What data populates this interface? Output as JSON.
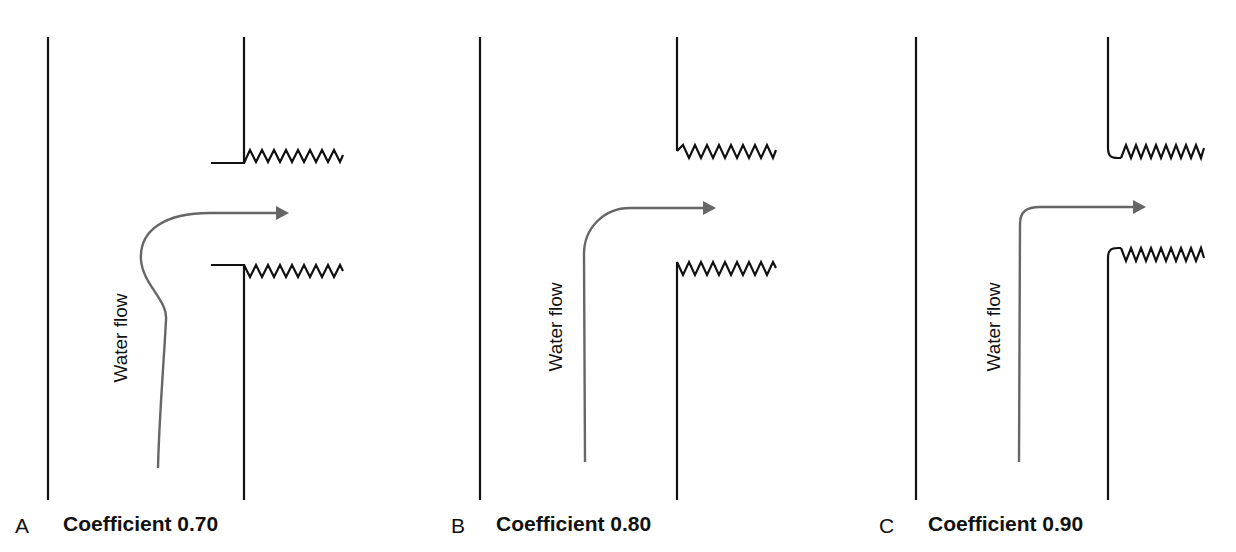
{
  "figure": {
    "panels": [
      {
        "id": "A",
        "letter": "A",
        "caption": "Coefficient 0.70",
        "flow_label": "Water flow",
        "inlet_type": "re-entrant (flanged projecting inlet)"
      },
      {
        "id": "B",
        "letter": "B",
        "caption": "Coefficient 0.80",
        "flow_label": "Water flow",
        "inlet_type": "square-edged flush inlet"
      },
      {
        "id": "C",
        "letter": "C",
        "caption": "Coefficient 0.90",
        "flow_label": "Water flow",
        "inlet_type": "rounded (bell-mouth) inlet"
      }
    ],
    "colors": {
      "wall": "#111111",
      "flow_arrow": "#666666",
      "background": "#ffffff"
    }
  }
}
